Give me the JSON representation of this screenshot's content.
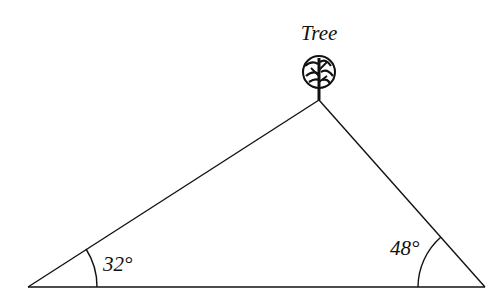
{
  "diagram": {
    "type": "triangle",
    "labels": {
      "apex": "Tree",
      "left_angle": "32°",
      "right_angle": "48°"
    },
    "geometry": {
      "left_vertex": [
        28,
        287
      ],
      "right_vertex": [
        485,
        287
      ],
      "apex": [
        319,
        100
      ]
    },
    "colors": {
      "stroke": "#111111",
      "background": "#ffffff"
    }
  }
}
